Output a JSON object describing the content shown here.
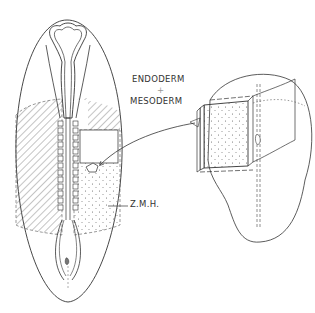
{
  "figure": {
    "labels": {
      "endoderm": "ENDODERM",
      "plus": "+",
      "mesoderm": "MESODERM",
      "zmh": "Z.M.H."
    },
    "parts": {
      "left": "embryo-dorsal-view",
      "right": "excised-tissue-block-explant"
    },
    "colors": {
      "line": "#3a3a3a",
      "background": "#ffffff"
    }
  }
}
